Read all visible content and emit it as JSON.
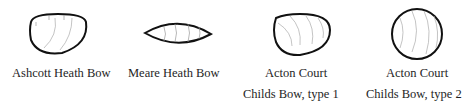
{
  "diagram": {
    "type": "bow-cross-sections",
    "items": [
      {
        "id": "ashcott",
        "label_lines": [
          "Ashcott Heath Bow"
        ],
        "shape": "D-section (flat top, rounded belly)"
      },
      {
        "id": "meare",
        "label_lines": [
          "Meare Heath Bow"
        ],
        "shape": "lenticular / lens-shaped"
      },
      {
        "id": "acton1",
        "label_lines": [
          "Acton Court",
          "Childs Bow, type 1"
        ],
        "shape": "D-section"
      },
      {
        "id": "acton2",
        "label_lines": [
          "Acton Court",
          "Childs Bow, type 2"
        ],
        "shape": "circular"
      }
    ],
    "colors": {
      "outline": "#111111",
      "grain": "#9a9a9a",
      "text": "#1e1e1e"
    }
  }
}
